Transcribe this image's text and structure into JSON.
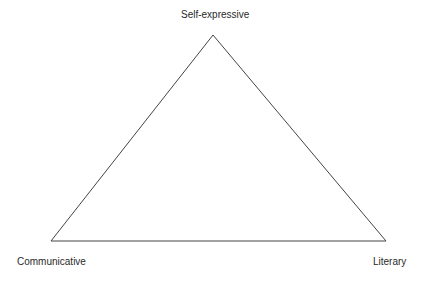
{
  "diagram": {
    "type": "triangle",
    "vertices": {
      "top": {
        "label": "Self-expressive"
      },
      "bottom_left": {
        "label": "Communicative"
      },
      "bottom_right": {
        "label": "Literary"
      }
    },
    "line_color": "#444444"
  }
}
